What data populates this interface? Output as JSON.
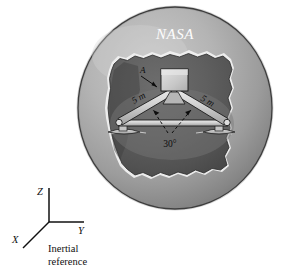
{
  "figure": {
    "title_on_body": "NASA",
    "labels": {
      "point_a": "A",
      "left_member_length": "5 m",
      "right_member_length": "5 m",
      "apex_angle": "30°"
    },
    "axes": {
      "z_label": "Z",
      "y_label": "Y",
      "x_label": "X",
      "caption_line1": "Inertial",
      "caption_line2": "reference"
    },
    "colors": {
      "sphere_light": "#b9b9b9",
      "sphere_mid": "#9e9e9e",
      "sphere_dark": "#7e7e7e",
      "crater_dark": "#5c5c5c",
      "crater_darkest": "#4a4a4a",
      "rim_highlight": "#e8e8e8",
      "truss_light": "#d8d8d8",
      "truss_shade": "#9a9a9a",
      "box_fill": "#c9c9c9",
      "outline": "#1a1a1a",
      "text_dark": "#101010",
      "text_light": "#fdfdfd",
      "background": "#ffffff"
    }
  }
}
